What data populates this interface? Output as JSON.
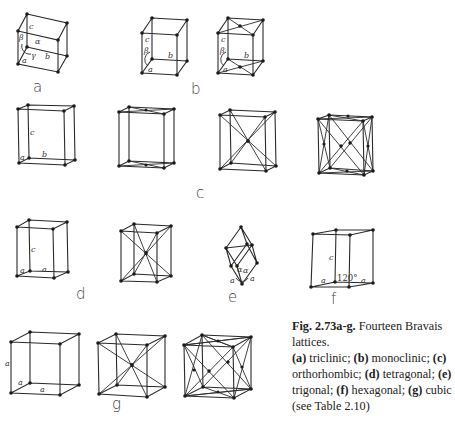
{
  "figure": {
    "number": "Fig. 2.73a-g.",
    "title": "Fourteen Bravais lattices.",
    "caption_parts": [
      {
        "key": "(a)",
        "text": " triclinic; "
      },
      {
        "key": "(b)",
        "text": " monoclinic; "
      },
      {
        "key": "(c)",
        "text": " orthorhombic; "
      },
      {
        "key": "(d)",
        "text": " tetragonal; "
      },
      {
        "key": "(e)",
        "text": " trigonal; "
      },
      {
        "key": "(f)",
        "text": " hexagonal; "
      },
      {
        "key": "(g)",
        "text": " cubic"
      }
    ],
    "reference": "(see Table 2.10)"
  },
  "panels": {
    "a": {
      "label": "a",
      "system": "triclinic",
      "lattices": [
        "P"
      ],
      "axis_labels": [
        "a",
        "b",
        "c",
        "α",
        "β",
        "γ"
      ]
    },
    "b": {
      "label": "b",
      "system": "monoclinic",
      "lattices": [
        "P",
        "C"
      ],
      "axis_labels": [
        "a",
        "b",
        "c",
        "β"
      ]
    },
    "c": {
      "label": "c",
      "system": "orthorhombic",
      "lattices": [
        "P",
        "C",
        "I",
        "F"
      ],
      "axis_labels": [
        "a",
        "b",
        "c"
      ]
    },
    "d": {
      "label": "d",
      "system": "tetragonal",
      "lattices": [
        "P",
        "I"
      ],
      "axis_labels": [
        "a",
        "a",
        "c"
      ]
    },
    "e": {
      "label": "e",
      "system": "trigonal",
      "lattices": [
        "R"
      ],
      "axis_labels": [
        "a",
        "a",
        "α",
        "α"
      ]
    },
    "f": {
      "label": "f",
      "system": "hexagonal",
      "lattices": [
        "P"
      ],
      "axis_labels": [
        "a",
        "a",
        "c",
        "120°"
      ]
    },
    "g": {
      "label": "g",
      "system": "cubic",
      "lattices": [
        "P",
        "I",
        "F"
      ],
      "axis_labels": [
        "a",
        "a",
        "a"
      ]
    }
  },
  "labels": {
    "a_a": "a",
    "a_b": "b",
    "a_c": "c",
    "a_alpha": "α",
    "a_beta": "β",
    "a_gamma": "γ",
    "b_a": "a",
    "b_b": "b",
    "b_c": "c",
    "b_beta": "β",
    "c_a": "a",
    "c_b": "b",
    "c_c": "c",
    "d_a1": "a",
    "d_a2": "a",
    "d_c": "c",
    "e_a1": "a",
    "e_a2": "a",
    "e_alpha1": "α",
    "e_alpha2": "α",
    "f_a1": "a",
    "f_a2": "a",
    "f_c": "c",
    "f_angle": "120°",
    "g_a1": "a",
    "g_a2": "a",
    "g_a3": "a"
  }
}
